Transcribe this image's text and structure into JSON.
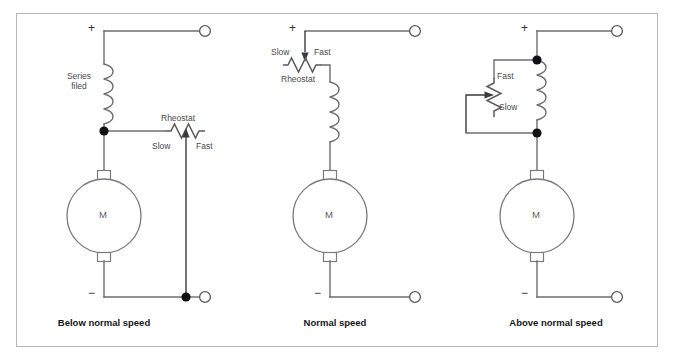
{
  "figure": {
    "border_color": "#b6b6b6",
    "wire_color": "#6e6e72",
    "dot_color": "#111114"
  },
  "circuits": [
    {
      "id": "below-normal-speed",
      "caption": "Below normal speed",
      "polarity_positive": "+",
      "polarity_negative": "−",
      "motor_label": "M",
      "field_label": "Series\nfiled",
      "field_label_line1": "Series",
      "field_label_line2": "filed",
      "rheostat_label": "Rheostat",
      "rheostat_low_label": "Slow",
      "rheostat_high_label": "Fast",
      "rheostat_orientation": "horizontal",
      "junction_dots": 2,
      "terminals": 2
    },
    {
      "id": "normal-speed",
      "caption": "Normal speed",
      "polarity_positive": "+",
      "polarity_negative": "−",
      "motor_label": "M",
      "field_label": "",
      "rheostat_label": "Rheostat",
      "rheostat_low_label": "Slow",
      "rheostat_high_label": "Fast",
      "rheostat_orientation": "horizontal",
      "junction_dots": 0,
      "terminals": 2
    },
    {
      "id": "above-normal-speed",
      "caption": "Above normal speed",
      "polarity_positive": "+",
      "polarity_negative": "−",
      "motor_label": "M",
      "field_label": "",
      "rheostat_label": "",
      "rheostat_low_label": "Slow",
      "rheostat_high_label": "Fast",
      "rheostat_orientation": "vertical",
      "junction_dots": 2,
      "terminals": 2
    }
  ]
}
